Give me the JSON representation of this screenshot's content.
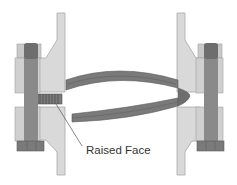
{
  "diagram": {
    "labels": [
      {
        "id": "raised-face",
        "text": "Raised Face"
      }
    ],
    "colors": {
      "background": "#ffffff",
      "flange_light": "#d9d9d9",
      "flange_outline": "#a8a8a8",
      "bolt_dark": "#6e6e6e",
      "bolt_shank": "#8a8a8a",
      "nut_light": "#c9c9c9",
      "gasket": "#7a7a7a",
      "gasket_edge": "#5c5c5c",
      "leader_line": "#555555",
      "text": "#333333"
    }
  }
}
